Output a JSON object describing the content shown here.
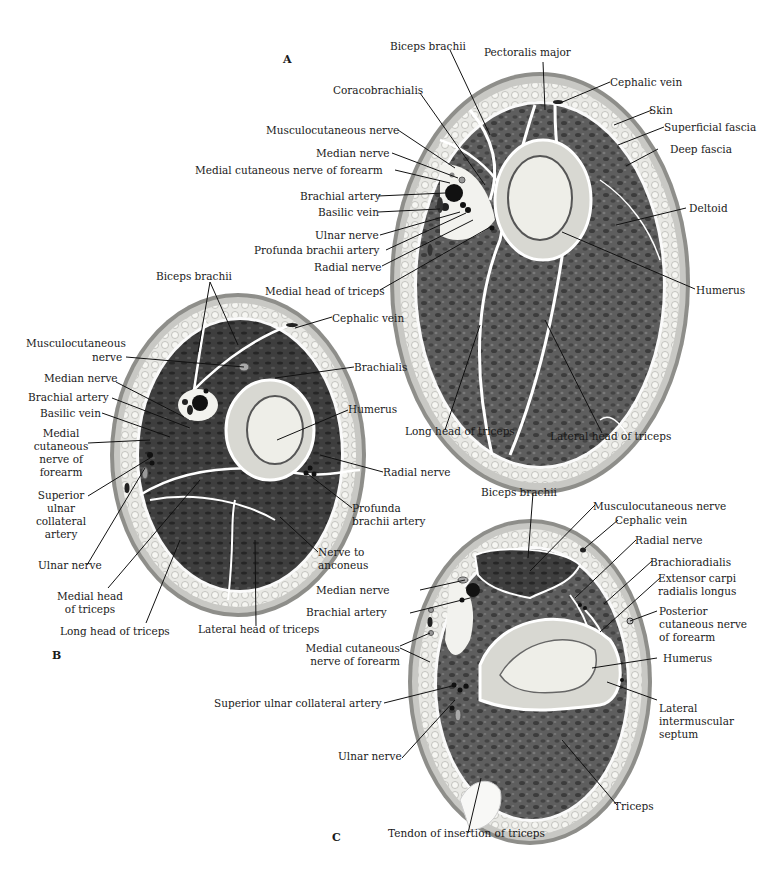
{
  "figure": {
    "panels": [
      {
        "id": "A",
        "labels": {
          "biceps_brachii": "Biceps brachii",
          "pectoralis_major": "Pectoralis major",
          "cephalic_vein": "Cephalic vein",
          "coracobrachialis": "Coracobrachialis",
          "skin": "Skin",
          "superficial_fascia": "Superficial fascia",
          "deep_fascia": "Deep fascia",
          "musculocutaneous_nerve": "Musculocutaneous nerve",
          "median_nerve": "Median nerve",
          "medial_cutaneous_nerve_forearm": "Medial cutaneous nerve of forearm",
          "brachial_artery": "Brachial artery",
          "basilic_vein": "Basilic vein",
          "deltoid": "Deltoid",
          "ulnar_nerve": "Ulnar nerve",
          "profunda_brachii_artery": "Profunda brachii artery",
          "radial_nerve": "Radial nerve",
          "medial_head_triceps": "Medial head of triceps",
          "humerus": "Humerus",
          "long_head_triceps": "Long head of triceps",
          "lateral_head_triceps": "Lateral head of triceps"
        }
      },
      {
        "id": "B",
        "labels": {
          "biceps_brachii": "Biceps brachii",
          "cephalic_vein": "Cephalic vein",
          "musculocutaneous_nerve_1": "Musculocutaneous",
          "musculocutaneous_nerve_2": "nerve",
          "brachialis": "Brachialis",
          "median_nerve": "Median nerve",
          "brachial_artery": "Brachial artery",
          "basilic_vein": "Basilic vein",
          "humerus": "Humerus",
          "medial_cutaneous_1": "Medial",
          "medial_cutaneous_2": "cutaneous",
          "medial_cutaneous_3": "nerve of",
          "medial_cutaneous_4": "forearm",
          "radial_nerve": "Radial nerve",
          "superior_ulnar_1": "Superior",
          "superior_ulnar_2": "ulnar",
          "superior_ulnar_3": "collateral",
          "superior_ulnar_4": "artery",
          "profunda_1": "Profunda",
          "profunda_2": "brachii artery",
          "ulnar_nerve": "Ulnar nerve",
          "nerve_anconeus_1": "Nerve to",
          "nerve_anconeus_2": "anconeus",
          "medial_head_1": "Medial head",
          "medial_head_2": "of triceps",
          "long_head_triceps": "Long head of triceps",
          "lateral_head_triceps": "Lateral head of triceps"
        }
      },
      {
        "id": "C",
        "labels": {
          "biceps_brachii": "Biceps brachii",
          "musculocutaneous_nerve": "Musculocutaneous nerve",
          "cephalic_vein": "Cephalic vein",
          "radial_nerve": "Radial nerve",
          "brachioradialis": "Brachioradialis",
          "ecrl_1": "Extensor carpi",
          "ecrl_2": "radialis longus",
          "median_nerve": "Median nerve",
          "brachial_artery": "Brachial artery",
          "post_cut_1": "Posterior",
          "post_cut_2": "cutaneous nerve",
          "post_cut_3": "of forearm",
          "medial_cutaneous_1": "Medial cutaneous",
          "medial_cutaneous_2": "nerve of forearm",
          "humerus": "Humerus",
          "superior_ulnar_collateral_artery": "Superior ulnar collateral artery",
          "lateral_septum_1": "Lateral",
          "lateral_septum_2": "intermuscular",
          "lateral_septum_3": "septum",
          "ulnar_nerve": "Ulnar nerve",
          "triceps": "Triceps",
          "tendon_insertion_triceps": "Tendon of insertion of triceps"
        }
      }
    ],
    "colors": {
      "muscle": "#5a5a5a",
      "muscle_dark": "#3a3a3a",
      "skin": "#9a9a9a",
      "fat": "#e4e4e2",
      "bone_cortex": "#d6d6d0",
      "bone_marrow": "#eeeeea",
      "fascia": "#ffffff",
      "vessel": "#111111",
      "leader_line": "#111111"
    }
  }
}
